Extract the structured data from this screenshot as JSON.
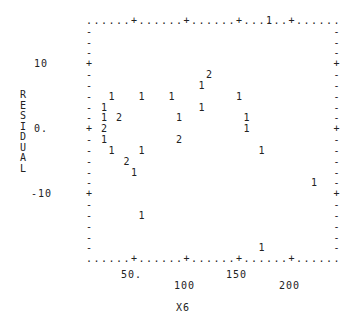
{
  "chart_data": {
    "type": "scatter",
    "style": "line-printer plot (counts of overlapping points shown as digits)",
    "title": "",
    "xlabel": "X6",
    "ylabel": "RESIDUAL",
    "x_ticks": [
      "50.",
      "100",
      "150",
      "200"
    ],
    "y_ticks": [
      "10",
      "0.",
      "-10"
    ],
    "xlim": [
      10,
      230
    ],
    "ylim": [
      -20,
      17
    ],
    "grid": false,
    "points": [
      {
        "x": 175,
        "y": 16.5,
        "count": 1
      },
      {
        "x": 120,
        "y": 8.5,
        "count": 2
      },
      {
        "x": 112,
        "y": 6.7,
        "count": 1
      },
      {
        "x": 30,
        "y": 5.0,
        "count": 1
      },
      {
        "x": 55,
        "y": 5.0,
        "count": 1
      },
      {
        "x": 87,
        "y": 5.0,
        "count": 1
      },
      {
        "x": 148,
        "y": 5.0,
        "count": 1
      },
      {
        "x": 23,
        "y": 3.3,
        "count": 1
      },
      {
        "x": 115,
        "y": 3.3,
        "count": 1
      },
      {
        "x": 18,
        "y": 1.7,
        "count": 1
      },
      {
        "x": 37,
        "y": 1.7,
        "count": 2
      },
      {
        "x": 95,
        "y": 1.7,
        "count": 1
      },
      {
        "x": 155,
        "y": 1.7,
        "count": 1
      },
      {
        "x": 18,
        "y": 0.0,
        "count": 2
      },
      {
        "x": 155,
        "y": 0.0,
        "count": 1
      },
      {
        "x": 18,
        "y": -1.7,
        "count": 1
      },
      {
        "x": 95,
        "y": -1.7,
        "count": 2
      },
      {
        "x": 30,
        "y": -3.3,
        "count": 1
      },
      {
        "x": 55,
        "y": -3.3,
        "count": 1
      },
      {
        "x": 170,
        "y": -3.3,
        "count": 1
      },
      {
        "x": 40,
        "y": -5.0,
        "count": 2
      },
      {
        "x": 52,
        "y": -6.7,
        "count": 1
      },
      {
        "x": 218,
        "y": -8.3,
        "count": 1
      },
      {
        "x": 60,
        "y": -13.3,
        "count": 1
      },
      {
        "x": 170,
        "y": -20.0,
        "count": 1
      }
    ]
  },
  "plot": {
    "top_border": ". . . . . . + . . . . . . . + . . . . . . . + . . . . . . . + . . . . .",
    "y_axis_label_letters": [
      "R",
      "E",
      "S",
      "I",
      "D",
      "U",
      "A",
      "L"
    ],
    "y_tick_labels": {
      "t10": "10",
      "t0": "0.",
      "tm10": "-10"
    },
    "x_tick_labels": {
      "t50": "50.",
      "t100": "100",
      "t150": "150",
      "t200": "200"
    },
    "x_axis_label": "X6"
  }
}
